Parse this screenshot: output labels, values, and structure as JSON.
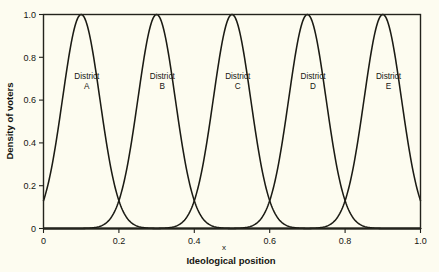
{
  "chart_data": {
    "type": "line",
    "title": "",
    "xlabel": "Ideological position",
    "ylabel": "Density of voters",
    "x_var_label": "x",
    "xlim": [
      0,
      1
    ],
    "ylim": [
      0,
      1
    ],
    "grid": false,
    "legend": "inline-labels",
    "x_ticks": [
      "0",
      "0.2",
      "0.4",
      "0.6",
      "0.8",
      "1.0"
    ],
    "x_tick_values": [
      0,
      0.2,
      0.4,
      0.6,
      0.8,
      1.0
    ],
    "y_ticks": [
      "0",
      "0.2",
      "0.4",
      "0.6",
      "0.8",
      "1.0"
    ],
    "y_tick_values": [
      0,
      0.2,
      0.4,
      0.6,
      0.8,
      1.0
    ],
    "curve_shape": "gaussian",
    "sigma": 0.0495,
    "peak_value": 1.0,
    "crossing_value": 0.37,
    "series": [
      {
        "name": "District A",
        "label_line1": "District",
        "label_line2": "A",
        "mean": 0.1,
        "peak": 1.0,
        "label_x": 0.115,
        "label_y": 0.7
      },
      {
        "name": "District B",
        "label_line1": "District",
        "label_line2": "B",
        "mean": 0.3,
        "peak": 1.0,
        "label_x": 0.315,
        "label_y": 0.7
      },
      {
        "name": "District C",
        "label_line1": "District",
        "label_line2": "C",
        "mean": 0.5,
        "peak": 1.0,
        "label_x": 0.515,
        "label_y": 0.7
      },
      {
        "name": "District D",
        "label_line1": "District",
        "label_line2": "D",
        "mean": 0.7,
        "peak": 1.0,
        "label_x": 0.715,
        "label_y": 0.7
      },
      {
        "name": "District E",
        "label_line1": "District",
        "label_line2": "E",
        "mean": 0.9,
        "peak": 1.0,
        "label_x": 0.915,
        "label_y": 0.7
      }
    ],
    "colors": {
      "background": "#fdfcf0",
      "curve": "#1b1b14",
      "axis": "#23231c",
      "text": "#151510"
    }
  }
}
